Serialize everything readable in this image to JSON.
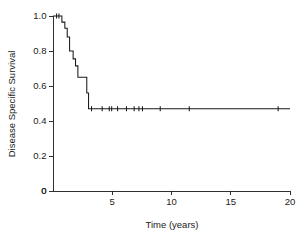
{
  "chart_data": {
    "type": "line",
    "subtype": "kaplan-meier-step",
    "title": "",
    "xlabel": "Time (years)",
    "ylabel": "Disease Specific Survival",
    "xlim": [
      0,
      20
    ],
    "ylim": [
      0,
      1.0
    ],
    "grid": false,
    "legend": "none",
    "xticks": [
      0,
      5,
      10,
      15,
      20
    ],
    "xtick_labels": [
      "0",
      "5",
      "10",
      "15",
      "20"
    ],
    "yticks": [
      0,
      0.2,
      0.4,
      0.6,
      0.8,
      1.0
    ],
    "ytick_labels": [
      "0",
      "0.2",
      "0.4",
      "0.6",
      "0.8",
      "1.0"
    ],
    "series": [
      {
        "name": "Disease Specific Survival",
        "color": "#1a1a1a",
        "step_points": [
          {
            "x": 0.0,
            "y": 1.0
          },
          {
            "x": 0.75,
            "y": 1.0
          },
          {
            "x": 0.75,
            "y": 0.965
          },
          {
            "x": 1.0,
            "y": 0.965
          },
          {
            "x": 1.0,
            "y": 0.93
          },
          {
            "x": 1.2,
            "y": 0.93
          },
          {
            "x": 1.2,
            "y": 0.88
          },
          {
            "x": 1.4,
            "y": 0.88
          },
          {
            "x": 1.4,
            "y": 0.8
          },
          {
            "x": 1.7,
            "y": 0.8
          },
          {
            "x": 1.7,
            "y": 0.755
          },
          {
            "x": 1.9,
            "y": 0.755
          },
          {
            "x": 1.9,
            "y": 0.715
          },
          {
            "x": 2.1,
            "y": 0.715
          },
          {
            "x": 2.1,
            "y": 0.65
          },
          {
            "x": 2.85,
            "y": 0.65
          },
          {
            "x": 2.85,
            "y": 0.56
          },
          {
            "x": 3.0,
            "y": 0.56
          },
          {
            "x": 3.0,
            "y": 0.47
          },
          {
            "x": 20.0,
            "y": 0.47
          }
        ],
        "censored": [
          {
            "x": 0.3,
            "y": 1.0
          },
          {
            "x": 0.5,
            "y": 1.0
          },
          {
            "x": 3.25,
            "y": 0.47
          },
          {
            "x": 4.15,
            "y": 0.47
          },
          {
            "x": 4.75,
            "y": 0.47
          },
          {
            "x": 4.95,
            "y": 0.47
          },
          {
            "x": 5.45,
            "y": 0.47
          },
          {
            "x": 6.2,
            "y": 0.47
          },
          {
            "x": 6.85,
            "y": 0.47
          },
          {
            "x": 7.25,
            "y": 0.47
          },
          {
            "x": 7.55,
            "y": 0.47
          },
          {
            "x": 9.05,
            "y": 0.47
          },
          {
            "x": 11.5,
            "y": 0.47
          },
          {
            "x": 19.0,
            "y": 0.47
          }
        ]
      }
    ]
  }
}
